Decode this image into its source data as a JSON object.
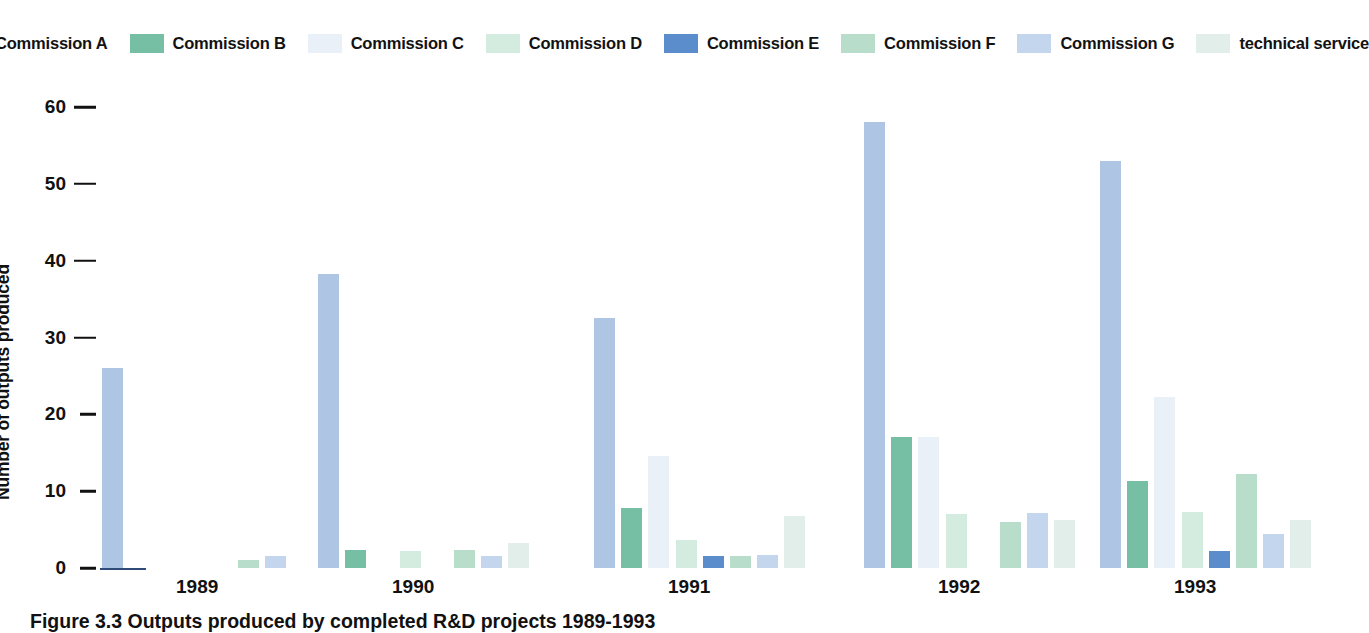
{
  "chart_data": {
    "type": "bar",
    "title": "",
    "caption": "Figure 3.3 Outputs produced by completed R&D projects 1989-1993",
    "xlabel": "",
    "ylabel": "Number of outputs produced",
    "categories": [
      "1989",
      "1990",
      "1991",
      "1992",
      "1993"
    ],
    "ylim": [
      0,
      60
    ],
    "yticks": [
      0,
      10,
      20,
      30,
      40,
      50,
      60
    ],
    "ytick_labels": [
      "0",
      "10",
      "20",
      "30",
      "40",
      "50",
      "60"
    ],
    "grid": false,
    "legend_position": "top",
    "series": [
      {
        "name": "Commission A",
        "color": "#aec5e3",
        "values": [
          26.0,
          38.3,
          32.5,
          58.0,
          53.0
        ]
      },
      {
        "name": "Commission B",
        "color": "#76bfa4",
        "values": [
          0.0,
          2.3,
          7.8,
          17.0,
          11.3
        ]
      },
      {
        "name": "Commission C",
        "color": "#eaf0f7",
        "values": [
          0.0,
          0.0,
          14.6,
          17.0,
          22.3
        ]
      },
      {
        "name": "Commission D",
        "color": "#d3ecdf",
        "values": [
          0.0,
          2.2,
          3.7,
          7.0,
          7.3
        ]
      },
      {
        "name": "Commission E",
        "color": "#5b8ccb",
        "values": [
          0.0,
          0.0,
          1.6,
          0.0,
          2.2
        ]
      },
      {
        "name": "Commission F",
        "color": "#b8ddcb",
        "values": [
          1.0,
          2.3,
          1.6,
          6.0,
          12.3
        ]
      },
      {
        "name": "Commission G",
        "color": "#c3d6ee",
        "values": [
          1.6,
          1.5,
          1.7,
          7.2,
          4.4
        ]
      },
      {
        "name": "technical service",
        "color": "#e2eee9",
        "values": [
          0.0,
          3.2,
          6.8,
          6.2,
          6.3
        ]
      }
    ]
  },
  "axis": {
    "y_title": "Number of outputs produced"
  }
}
